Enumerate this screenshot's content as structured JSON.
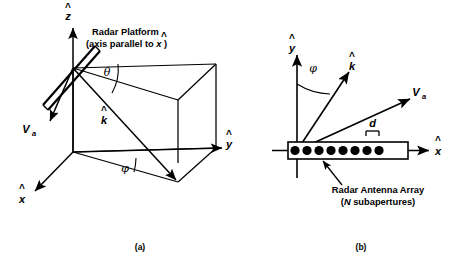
{
  "figure": {
    "title_visible": false,
    "background_color": "#ffffff",
    "line_color": "#000000",
    "panels": [
      {
        "id": "panel-a",
        "caption": "(a)",
        "caption_pos": {
          "x": 140,
          "y": 247
        },
        "axes": [
          {
            "name": "z-axis",
            "label": "z",
            "hat": true,
            "label_pos": {
              "x": 68,
              "y": 17
            }
          },
          {
            "name": "y-axis",
            "label": "y",
            "hat": true,
            "label_pos": {
              "x": 227,
              "y": 146
            }
          },
          {
            "name": "x-axis",
            "label": "x",
            "hat": true,
            "label_pos": {
              "x": 22,
              "y": 200
            }
          }
        ],
        "vectors": [
          {
            "name": "velocity-vector",
            "label": "V",
            "subscript": "a",
            "label_pos": {
              "x": 26,
              "y": 131
            }
          },
          {
            "name": "wave-vector",
            "label": "k",
            "hat": true,
            "label_pos": {
              "x": 103,
              "y": 120
            }
          }
        ],
        "angles": [
          {
            "name": "theta-angle",
            "symbol": "θ",
            "label_pos": {
              "x": 106,
              "y": 72
            }
          },
          {
            "name": "phi-angle",
            "symbol": "φ",
            "label_pos": {
              "x": 124,
              "y": 168
            }
          }
        ],
        "annotations": [
          {
            "name": "radar-platform-label",
            "line1": "Radar Platform",
            "line2_pre": "(axis parallel to ",
            "line2_sym": "x",
            "line2_post": ")",
            "pos": {
              "x": 92,
              "y": 36
            }
          }
        ]
      },
      {
        "id": "panel-b",
        "caption": "(b)",
        "caption_pos": {
          "x": 361,
          "y": 247
        },
        "axes": [
          {
            "name": "y-axis",
            "label": "y",
            "hat": true,
            "label_pos": {
              "x": 292,
              "y": 50
            }
          },
          {
            "name": "x-axis",
            "label": "x",
            "hat": true,
            "label_pos": {
              "x": 437,
              "y": 155
            }
          }
        ],
        "vectors": [
          {
            "name": "wave-vector",
            "label": "k",
            "hat": true,
            "label_pos": {
              "x": 350,
              "y": 68
            }
          },
          {
            "name": "velocity-vector",
            "label": "V",
            "subscript": "a",
            "label_pos": {
              "x": 414,
              "y": 98
            }
          }
        ],
        "angles": [
          {
            "name": "phi-angle",
            "symbol": "φ",
            "label_pos": {
              "x": 312,
              "y": 68
            }
          }
        ],
        "spacing": {
          "name": "element-spacing",
          "label": "d",
          "label_pos": {
            "x": 372,
            "y": 127
          }
        },
        "array": {
          "name": "radar-antenna-array",
          "subaperture_count": 8,
          "box": {
            "x": 288,
            "y": 142,
            "width": 120,
            "height": 17
          },
          "dot_xs": [
            295,
            307,
            319,
            331,
            343,
            355,
            367,
            379
          ],
          "dot_cy": 150.5,
          "dot_r": 4.6
        },
        "annotations": [
          {
            "name": "antenna-array-label",
            "line1": "Radar Antenna Array",
            "line2_pre": "(",
            "line2_sym": "N",
            "line2_post": " subapertures)",
            "pos": {
              "x": 378,
              "y": 193
            }
          }
        ]
      }
    ]
  }
}
